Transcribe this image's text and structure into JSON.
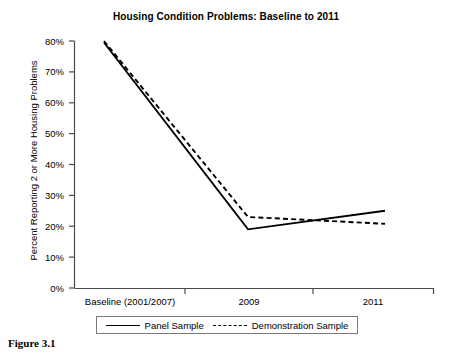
{
  "figure": {
    "caption": "Figure 3.1"
  },
  "chart_data": {
    "type": "line",
    "title": "Housing Condition Problems: Baseline to 2011",
    "xlabel": "",
    "ylabel": "Percent Reporting 2 or More Housing Problems",
    "categories": [
      "Baseline (2001/2007)",
      "2009",
      "2011"
    ],
    "series": [
      {
        "name": "Panel Sample",
        "style": "solid",
        "color": "#000000",
        "values": [
          79.5,
          19.0,
          25.0
        ]
      },
      {
        "name": "Demonstration Sample",
        "style": "dashed",
        "color": "#000000",
        "values": [
          80.0,
          23.0,
          20.8
        ]
      }
    ],
    "ylim": [
      0,
      80
    ],
    "yticks": [
      "0%",
      "10%",
      "20%",
      "30%",
      "40%",
      "50%",
      "60%",
      "70%",
      "80%"
    ],
    "ytick_values": [
      0,
      10,
      20,
      30,
      40,
      50,
      60,
      70,
      80
    ],
    "grid": false,
    "legend_position": "bottom"
  }
}
